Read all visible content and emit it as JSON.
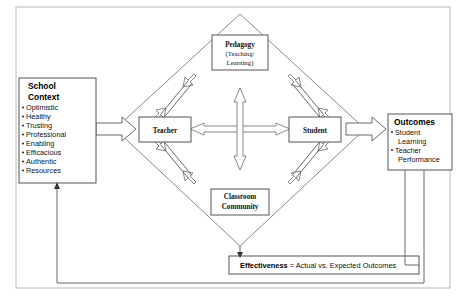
{
  "diagram": {
    "school_context": {
      "heading_line1": "School",
      "heading_line2": "Context",
      "bullets": [
        "Optimistic",
        "Healthy",
        "Trusting",
        "Professional",
        "Enabling",
        "Efficacious",
        "Authentic",
        "Resources"
      ]
    },
    "core": {
      "pedagogy": {
        "label": "Pedagogy",
        "sub_line1": "(Teaching/",
        "sub_line2": "Learning)"
      },
      "teacher": {
        "label": "Teacher"
      },
      "student": {
        "label": "Student"
      },
      "classroom_community": {
        "line1": "Classroom",
        "line2": "Community"
      }
    },
    "outcomes": {
      "heading": "Outcomes",
      "bullets": [
        {
          "line1": "Student",
          "line2": "Learning"
        },
        {
          "line1": "Teacher",
          "line2": "Performance"
        }
      ]
    },
    "effectiveness": {
      "bold_text": "Effectiveness",
      "rest_text": " = Actual vs. Expected Outcomes"
    },
    "colors": {
      "background": "#ffffff",
      "box_stroke": "#555555",
      "diamond_stroke": "#8a8a8a",
      "arrow_stroke": "#7a7a7a",
      "frame_stroke": "#b8b8b8",
      "text": "#111111"
    }
  }
}
